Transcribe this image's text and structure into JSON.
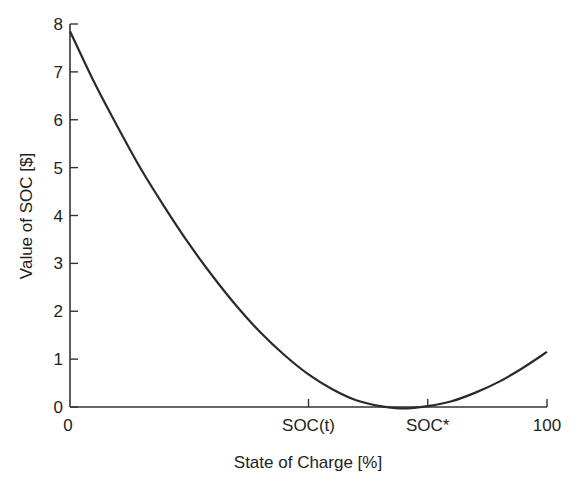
{
  "chart_data": {
    "type": "line",
    "title": "",
    "xlabel": "State of Charge [%]",
    "ylabel": "Value of SOC [$]",
    "xlim": [
      0,
      100
    ],
    "ylim": [
      0,
      8
    ],
    "grid": false,
    "legend": null,
    "y_ticks": [
      0,
      1,
      2,
      3,
      4,
      5,
      6,
      7,
      8
    ],
    "y_tick_labels": [
      "0",
      "1",
      "2",
      "3",
      "4",
      "5",
      "6",
      "7",
      "8"
    ],
    "x_ticks": [
      0,
      50,
      75,
      100
    ],
    "x_tick_labels": [
      "0",
      "SOC(t)",
      "SOC*",
      "100"
    ],
    "series": [
      {
        "name": "Value of SOC",
        "x": [
          0,
          5,
          10,
          15,
          20,
          25,
          30,
          35,
          40,
          45,
          50,
          55,
          60,
          65,
          70,
          75,
          80,
          85,
          90,
          95,
          100
        ],
        "y": [
          7.85,
          6.8,
          5.85,
          4.95,
          4.15,
          3.4,
          2.72,
          2.1,
          1.55,
          1.08,
          0.68,
          0.37,
          0.14,
          0.02,
          -0.03,
          0.02,
          0.12,
          0.3,
          0.53,
          0.82,
          1.15
        ]
      }
    ],
    "annotations": []
  },
  "axes": {
    "x_label": "State of Charge [%]",
    "y_label": "Value of SOC [$]",
    "x_tick_labels": [
      "0",
      "SOC(t)",
      "SOC*",
      "100"
    ],
    "y_tick_labels": [
      "0",
      "1",
      "2",
      "3",
      "4",
      "5",
      "6",
      "7",
      "8"
    ]
  },
  "colors": {
    "line": "#2a2a2a",
    "axis": "#333333",
    "background": "#ffffff"
  }
}
